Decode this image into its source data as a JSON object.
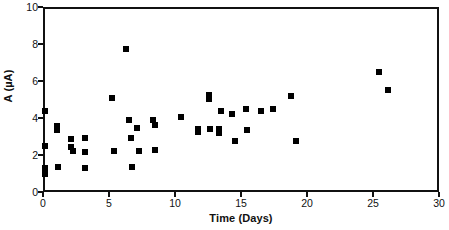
{
  "chart_data": {
    "type": "scatter",
    "title": "",
    "xlabel": "Time (Days)",
    "ylabel": "A (µA)",
    "xlim": [
      0,
      30
    ],
    "ylim": [
      0,
      10
    ],
    "xticks": [
      0,
      5,
      10,
      15,
      20,
      25,
      30
    ],
    "yticks": [
      0,
      2,
      4,
      6,
      8,
      10
    ],
    "xtick_labels": [
      "0",
      "5",
      "10",
      "15",
      "20",
      "25",
      "30"
    ],
    "ytick_labels": [
      "0",
      "2",
      "4",
      "6",
      "8",
      "10"
    ],
    "grid": false,
    "legend": null,
    "marker": "square",
    "marker_color": "#000000",
    "series": [
      {
        "name": "A",
        "points": [
          [
            0.0,
            4.5
          ],
          [
            0.0,
            2.6
          ],
          [
            0.0,
            1.4
          ],
          [
            0.0,
            1.1
          ],
          [
            0.9,
            3.7
          ],
          [
            0.9,
            3.45
          ],
          [
            1.0,
            1.45
          ],
          [
            2.0,
            3.0
          ],
          [
            2.0,
            2.55
          ],
          [
            2.1,
            2.35
          ],
          [
            3.0,
            3.05
          ],
          [
            3.0,
            2.25
          ],
          [
            3.0,
            1.4
          ],
          [
            5.1,
            5.2
          ],
          [
            5.2,
            2.35
          ],
          [
            6.1,
            7.85
          ],
          [
            6.4,
            4.0
          ],
          [
            6.5,
            3.05
          ],
          [
            6.6,
            1.45
          ],
          [
            7.0,
            3.55
          ],
          [
            7.1,
            2.3
          ],
          [
            8.2,
            4.0
          ],
          [
            8.3,
            3.75
          ],
          [
            8.3,
            2.4
          ],
          [
            10.3,
            4.15
          ],
          [
            11.6,
            3.5
          ],
          [
            11.6,
            3.35
          ],
          [
            12.4,
            5.35
          ],
          [
            12.4,
            5.15
          ],
          [
            12.5,
            3.5
          ],
          [
            13.2,
            3.5
          ],
          [
            13.2,
            3.3
          ],
          [
            13.3,
            4.5
          ],
          [
            14.2,
            4.3
          ],
          [
            14.4,
            2.85
          ],
          [
            15.2,
            4.6
          ],
          [
            15.3,
            3.45
          ],
          [
            16.4,
            4.5
          ],
          [
            17.3,
            4.6
          ],
          [
            18.6,
            5.3
          ],
          [
            19.0,
            2.85
          ],
          [
            25.3,
            6.6
          ],
          [
            26.0,
            5.6
          ]
        ]
      }
    ]
  },
  "axes": {
    "x_title": "Time (Days)",
    "y_title": "A (µA)"
  }
}
